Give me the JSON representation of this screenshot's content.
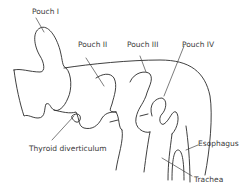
{
  "diagram": {
    "labels": {
      "pouch1": "Pouch I",
      "pouch2": "Pouch II",
      "pouch3": "Pouch III",
      "pouch4": "Pouch IV",
      "thyroid": "Thyroid diverticulum",
      "esophagus": "Esophagus",
      "trachea": "Trachea"
    },
    "colors": {
      "line": "#2a2a2a",
      "text": "#3a3a3a",
      "background": "#ffffff"
    }
  }
}
